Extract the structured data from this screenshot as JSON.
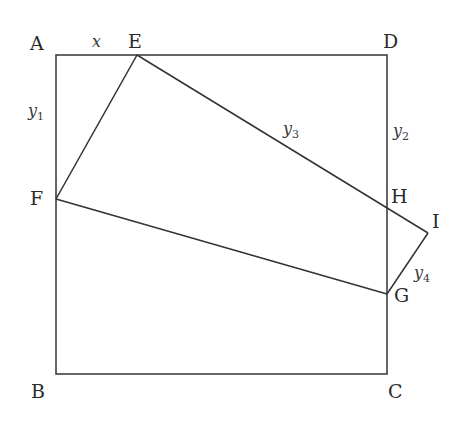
{
  "diagram": {
    "points": {
      "A": {
        "label": "A",
        "x": 56,
        "y": 55
      },
      "B": {
        "label": "B",
        "x": 56,
        "y": 374
      },
      "C": {
        "label": "C",
        "x": 387,
        "y": 374
      },
      "D": {
        "label": "D",
        "x": 387,
        "y": 55
      },
      "E": {
        "label": "E",
        "x": 137,
        "y": 55
      },
      "F": {
        "label": "F",
        "x": 56,
        "y": 199
      },
      "G": {
        "label": "G",
        "x": 387,
        "y": 294
      },
      "H": {
        "label": "H",
        "x": 387,
        "y": 207
      },
      "I": {
        "label": "I",
        "x": 428,
        "y": 233
      }
    },
    "segments": [
      [
        "A",
        "D"
      ],
      [
        "D",
        "C"
      ],
      [
        "C",
        "B"
      ],
      [
        "B",
        "A"
      ],
      [
        "E",
        "F"
      ],
      [
        "F",
        "G"
      ],
      [
        "G",
        "I"
      ],
      [
        "I",
        "E"
      ]
    ],
    "variables": {
      "x": {
        "base": "x",
        "sub": ""
      },
      "y1": {
        "base": "y",
        "sub": "1"
      },
      "y2": {
        "base": "y",
        "sub": "2"
      },
      "y3": {
        "base": "y",
        "sub": "3"
      },
      "y4": {
        "base": "y",
        "sub": "4"
      }
    },
    "colors": {
      "stroke": "#333333",
      "text": "#2a2a2a",
      "background": "#ffffff"
    }
  }
}
